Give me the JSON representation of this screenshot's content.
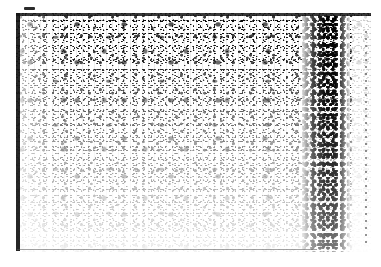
{
  "image": {
    "kind": "degraded-binarized-document-scan",
    "width_px": 381,
    "height_px": 267,
    "legible_text": "",
    "description": "Heavily degraded one-bit threshold scan of a document page; no characters are resolvable."
  },
  "canvas": {
    "background_color": "#ffffff",
    "ink_color": "#000000"
  },
  "plate": {
    "left_px": 16,
    "top_px": 13,
    "width_px": 355,
    "height_px": 239,
    "background_color": "#ffffff"
  },
  "marks": {
    "registration_dash": {
      "label": "registration dash",
      "color": "#2b2b2b",
      "left_px": 24,
      "top_px": 7,
      "width_px": 11,
      "height_px": 3
    },
    "top_rule": {
      "label": "top border rule",
      "color": "#1c1c1c",
      "thickness_px": 3
    },
    "left_rule": {
      "label": "left border rule",
      "color": "#141414",
      "thickness_px": 4
    },
    "bottom_rule": {
      "label": "bottom border rule",
      "color": "#545454",
      "thickness_px": 1
    },
    "right_dotted_rule": {
      "label": "right dotted rule",
      "color": "#3a3a3a",
      "left_px": 365,
      "dash_period_px": 7
    },
    "gutter_band": {
      "label": "binding gutter shadow band",
      "color": "#000000",
      "left_px": 302,
      "width_px": 48
    }
  },
  "texture": {
    "fine_grain": "fine speckle grain",
    "medium_blotches": "medium ink blotches",
    "coarse_clumps": "coarse ink clumps",
    "vertical_streaks": "vertical scanner streaking",
    "density_gradient": "ink density fades from top to bottom"
  }
}
